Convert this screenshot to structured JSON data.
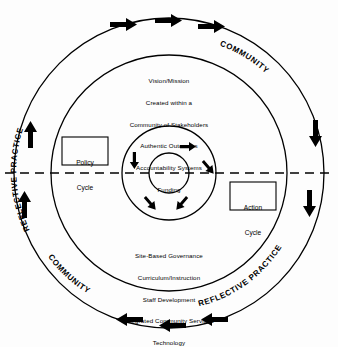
{
  "diagram": {
    "colors": {
      "stroke": "#000000",
      "background": "#fdfdfd",
      "text": "#000000"
    },
    "outer_ring_labels": [
      {
        "id": "reflective-practice-top-left",
        "text": "REFLECTIVE PRACTICE"
      },
      {
        "id": "community-top-right",
        "text": "COMMUNITY"
      },
      {
        "id": "community-bottom-left",
        "text": "COMMUNITY"
      },
      {
        "id": "reflective-practice-bottom-right",
        "text": "REFLECTIVE PRACTICE"
      }
    ],
    "boxes": [
      {
        "id": "policy-cycle",
        "line1": "Policy",
        "line2": "Cycle"
      },
      {
        "id": "action-cycle",
        "line1": "Action",
        "line2": "Cycle"
      }
    ],
    "upper_text_block": {
      "lines": [
        "Vision/Mission",
        "Created within a",
        "Community of Stakeholders",
        "Authentic Outcomes",
        "Accountability Systems",
        "Funding"
      ]
    },
    "lower_text_block": {
      "lines": [
        "Site-Based Governance",
        "Curriculum/Instruction",
        "Staff Development",
        "Integrated Community Services",
        "Technology"
      ]
    },
    "arrows": {
      "outer_top": 3,
      "outer_bottom": 3,
      "outer_left": 2,
      "outer_right": 2,
      "inner_ring": 5
    },
    "divider": {
      "id": "horizontal-dashed-divider",
      "style": "dashed"
    }
  }
}
